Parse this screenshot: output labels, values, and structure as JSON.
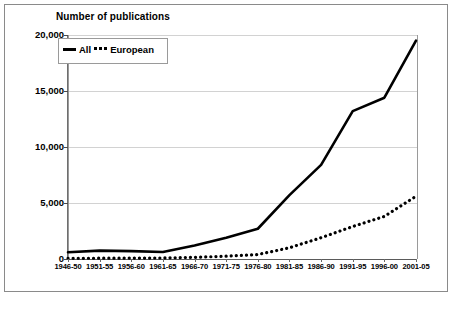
{
  "figure": {
    "title": "Number of publications",
    "border_color": "#8a8a8a",
    "background": "#ffffff",
    "series_color": "#000000",
    "gridline_color": "#d2d2d2"
  },
  "legend": {
    "position": "top-left-inside",
    "entries": [
      {
        "label": "All",
        "style": "solid"
      },
      {
        "label": "European",
        "style": "dotted"
      }
    ]
  },
  "axes": {
    "y_ticks": [
      "0",
      "5,000",
      "10,000",
      "15,000",
      "20,000"
    ],
    "x_ticks": [
      "1946-50",
      "1951-55",
      "1956-60",
      "1961-65",
      "1966-70",
      "1971-75",
      "1976-80",
      "1981-85",
      "1986-90",
      "1991-95",
      "1996-00",
      "2001-05"
    ]
  },
  "chart_data": {
    "type": "line",
    "title": "Number of publications",
    "xlabel": "",
    "ylabel": "",
    "ylim": [
      0,
      20000
    ],
    "yticks": [
      0,
      5000,
      10000,
      15000,
      20000
    ],
    "grid": true,
    "legend_position": "upper left",
    "categories": [
      "1946-50",
      "1951-55",
      "1956-60",
      "1961-65",
      "1966-70",
      "1971-75",
      "1976-80",
      "1981-85",
      "1986-90",
      "1991-95",
      "1996-00",
      "2001-05"
    ],
    "series": [
      {
        "name": "All",
        "style": "solid",
        "values": [
          600,
          750,
          700,
          620,
          1200,
          1900,
          2700,
          5700,
          8400,
          13200,
          14400,
          19500
        ]
      },
      {
        "name": "European",
        "style": "dotted",
        "values": [
          60,
          70,
          80,
          90,
          150,
          250,
          400,
          1000,
          1900,
          2900,
          3800,
          5600
        ]
      }
    ]
  }
}
